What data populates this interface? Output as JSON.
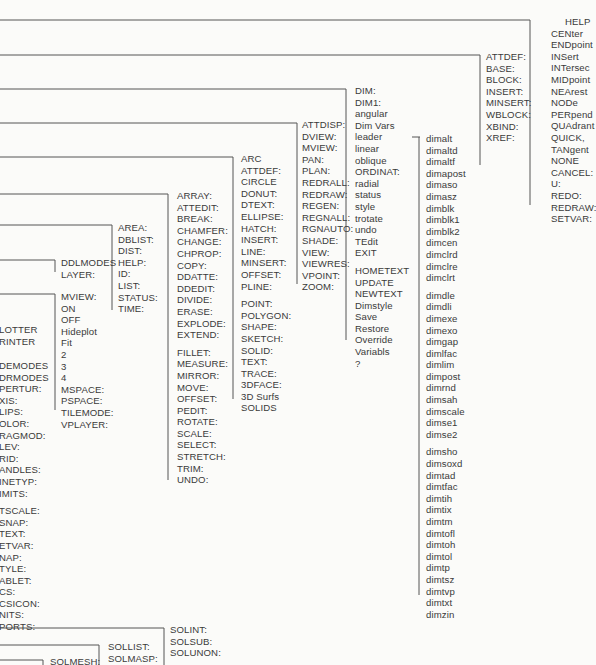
{
  "diagram": {
    "type": "menu-tree",
    "columns": [
      {
        "id": "osnap",
        "items": [
          "HELP",
          "CENter",
          "ENDpoint",
          "INSert",
          "INTersec",
          "MIDpoint",
          "NEArest",
          "NODe",
          "PERpend",
          "QUAdrant",
          "QUICK,",
          "TANgent",
          "NONE",
          "CANCEL:",
          "U:",
          "REDO:",
          "REDRAW:",
          "SETVAR:"
        ],
        "gaps_after": []
      },
      {
        "id": "blocks",
        "items": [
          "ATTDEF:",
          "BASE:",
          "BLOCK:",
          "INSERT:",
          "MINSERT:",
          "WBLOCK:",
          "XBIND:",
          "XREF:"
        ],
        "gaps_after": []
      },
      {
        "id": "dim",
        "items": [
          "DIM:",
          "DIM1:",
          "angular",
          "Dim  Vars",
          "leader",
          "linear",
          "oblique",
          "ORDINAT:",
          "radial",
          "status",
          "style",
          "trotate",
          "undo",
          "TEdit",
          "EXIT",
          "HOMETEXT",
          "UPDATE",
          "NEWTEXT",
          "Dimstyle",
          "Save",
          "Restore",
          "Override",
          "Variabls",
          "?"
        ],
        "gaps_after": [
          14
        ]
      },
      {
        "id": "dim-vars",
        "items": [
          "dimalt",
          "dimaltd",
          "dimaltf",
          "dimapost",
          "dimaso",
          "dimasz",
          "dimblk",
          "dimblk1",
          "dimblk2",
          "dimcen",
          "dimclrd",
          "dimclre",
          "dimclrt",
          "dimdle",
          "dimdli",
          "dimexe",
          "dimexo",
          "dimgap",
          "dimlfac",
          "dimlim",
          "dimpost",
          "dimrnd",
          "dimsah",
          "dimscale",
          "dimse1",
          "dimse2",
          "dimsho",
          "dimsoxd",
          "dimtad",
          "dimtfac",
          "dimtih",
          "dimtix",
          "dimtm",
          "dimtofl",
          "dimtoh",
          "dimtol",
          "dimtp",
          "dimtsz",
          "dimtvp",
          "dimtxt",
          "dimzin"
        ],
        "gaps_after": [
          12,
          25
        ]
      },
      {
        "id": "display",
        "items": [
          "ATTDISP:",
          "DVIEW:",
          "MVIEW:",
          "PAN:",
          "PLAN:",
          "REDRALL:",
          "REDRAW:",
          "REGEN:",
          "REGNALL:",
          "RGNAUTO:",
          "SHADE:",
          "VIEW:",
          "VIEWRES:",
          "VPOINT:",
          "ZOOM:"
        ],
        "gaps_after": []
      },
      {
        "id": "draw",
        "items": [
          "ARC",
          "ATTDEF:",
          "CIRCLE",
          "DONUT:",
          "DTEXT:",
          "ELLIPSE:",
          "HATCH:",
          "INSERT:",
          "LINE:",
          "MINSERT:",
          "OFFSET:",
          "PLINE:",
          "POINT:",
          "POLYGON:",
          "SHAPE:",
          "SKETCH:",
          "SOLID:",
          "TEXT:",
          "TRACE:",
          "3DFACE:",
          "3D  Surfs",
          "SOLIDS"
        ],
        "gaps_after": [
          11
        ]
      },
      {
        "id": "edit",
        "items": [
          "ARRAY:",
          "ATTEDIT:",
          "BREAK:",
          "CHAMFER:",
          "CHANGE:",
          "CHPROP:",
          "COPY:",
          "DDATTE:",
          "DDEDIT:",
          "DIVIDE:",
          "ERASE:",
          "EXPLODE:",
          "EXTEND:",
          "FILLET:",
          "MEASURE:",
          "MIRROR:",
          "MOVE:",
          "OFFSET:",
          "PEDIT:",
          "ROTATE:",
          "SCALE:",
          "SELECT:",
          "STRETCH:",
          "TRIM:",
          "UNDO:"
        ],
        "gaps_after": [
          12
        ]
      },
      {
        "id": "inquiry",
        "items": [
          "AREA:",
          "DBLIST:",
          "DIST:",
          "HELP:",
          "ID:",
          "LIST:",
          "STATUS:",
          "TIME:"
        ],
        "gaps_after": []
      },
      {
        "id": "layer",
        "items": [
          "DDLMODES",
          "LAYER:"
        ],
        "gaps_after": []
      },
      {
        "id": "mview",
        "items": [
          "MVIEW:",
          "ON",
          "OFF",
          "Hideplot",
          "Fit",
          "2",
          "3",
          "4",
          "MSPACE:",
          "PSPACE:",
          "TILEMODE:",
          "VPLAYER:"
        ],
        "gaps_after": []
      },
      {
        "id": "plot",
        "items": [
          "LOTTER",
          "RINTER"
        ],
        "gaps_after": []
      },
      {
        "id": "settings",
        "items": [
          "DEMODES",
          "DRMODES",
          "PERTUR:",
          "XIS:",
          "LIPS:",
          "OLOR:",
          "RAGMOD:",
          "LEV:",
          "RID:",
          "ANDLES:",
          "INETYP:",
          "IMITS:",
          "TSCALE:",
          "SNAP:",
          "TEXT:",
          "ETVAR:",
          "NAP:",
          "TYLE:",
          "ABLET:",
          "CS:",
          "CSICON:",
          "NITS:",
          "PORTS:"
        ],
        "gaps_after": [
          11
        ]
      },
      {
        "id": "sol-3",
        "items": [
          "SOLINT:",
          "SOLSUB:",
          "SOLUNON:"
        ],
        "gaps_after": []
      },
      {
        "id": "sol-2",
        "items": [
          "SOLLIST:",
          "SOLMASP:"
        ],
        "gaps_after": []
      },
      {
        "id": "sol-1",
        "items": [
          "SOLMESH:"
        ],
        "gaps_after": []
      }
    ]
  }
}
